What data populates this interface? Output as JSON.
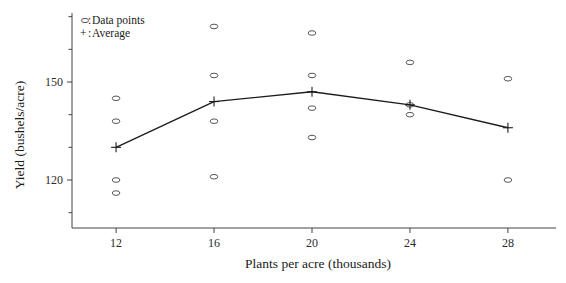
{
  "chart_data": {
    "type": "scatter",
    "title": "",
    "xlabel": "Plants per acre (thousands)",
    "ylabel": "Yield (bushels/acre)",
    "xlim": [
      10.2,
      29.8
    ],
    "ylim": [
      110,
      172
    ],
    "xticks": [
      12,
      16,
      20,
      24,
      28
    ],
    "xtick_labels": [
      "12",
      "16",
      "20",
      "24",
      "28"
    ],
    "yticks": [
      120,
      150
    ],
    "ytick_labels": [
      "120",
      "150"
    ],
    "yminorticks": [
      110,
      130,
      140,
      160,
      170
    ],
    "grid": false,
    "categories": [
      12,
      16,
      20,
      24,
      28
    ],
    "series": [
      {
        "name": "Data points",
        "marker": "circle",
        "points": [
          {
            "x": 12,
            "y": 145
          },
          {
            "x": 12,
            "y": 138
          },
          {
            "x": 12,
            "y": 120
          },
          {
            "x": 12,
            "y": 116
          },
          {
            "x": 16,
            "y": 167
          },
          {
            "x": 16,
            "y": 152
          },
          {
            "x": 16,
            "y": 138
          },
          {
            "x": 16,
            "y": 121
          },
          {
            "x": 20,
            "y": 165
          },
          {
            "x": 20,
            "y": 152
          },
          {
            "x": 20,
            "y": 142
          },
          {
            "x": 20,
            "y": 133
          },
          {
            "x": 24,
            "y": 156
          },
          {
            "x": 24,
            "y": 143
          },
          {
            "x": 24,
            "y": 140
          },
          {
            "x": 28,
            "y": 151
          },
          {
            "x": 28,
            "y": 120
          }
        ]
      },
      {
        "name": "Average",
        "marker": "plus",
        "values": [
          130,
          144,
          147,
          143,
          136
        ]
      }
    ],
    "legend_position": "top-left",
    "legend": [
      {
        "marker": "circle",
        "separator": ":",
        "label": "Data points"
      },
      {
        "marker": "+",
        "separator": ":",
        "label": "Average"
      }
    ]
  },
  "colors": {
    "axis": "#444444",
    "line": "#1d1d1d",
    "marker": "#555555",
    "background": "#ffffff"
  }
}
